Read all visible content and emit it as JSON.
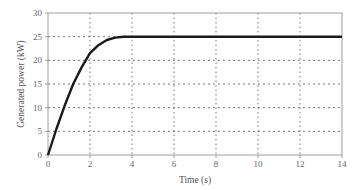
{
  "chart_data": {
    "type": "line",
    "title": "",
    "xlabel": "Time (s)",
    "ylabel": "Generated power (kW)",
    "xlim": [
      0,
      14
    ],
    "ylim": [
      0,
      30
    ],
    "xticks": [
      0,
      2,
      4,
      6,
      8,
      10,
      12,
      14
    ],
    "yticks": [
      0,
      5,
      10,
      15,
      20,
      25,
      30
    ],
    "grid": true,
    "grid_style": "dotted",
    "legend": null,
    "series": [
      {
        "name": "Generated power",
        "color": "#1a1a1a",
        "x": [
          0,
          0.4,
          0.8,
          1.2,
          1.6,
          2.0,
          2.4,
          2.8,
          3.2,
          3.6,
          4.0,
          6.0,
          8.0,
          10.0,
          12.0,
          14.0
        ],
        "y": [
          0,
          5.5,
          10.5,
          15,
          18.5,
          21.5,
          23.2,
          24.3,
          24.8,
          25,
          25,
          25,
          25,
          25,
          25,
          25
        ]
      }
    ]
  }
}
